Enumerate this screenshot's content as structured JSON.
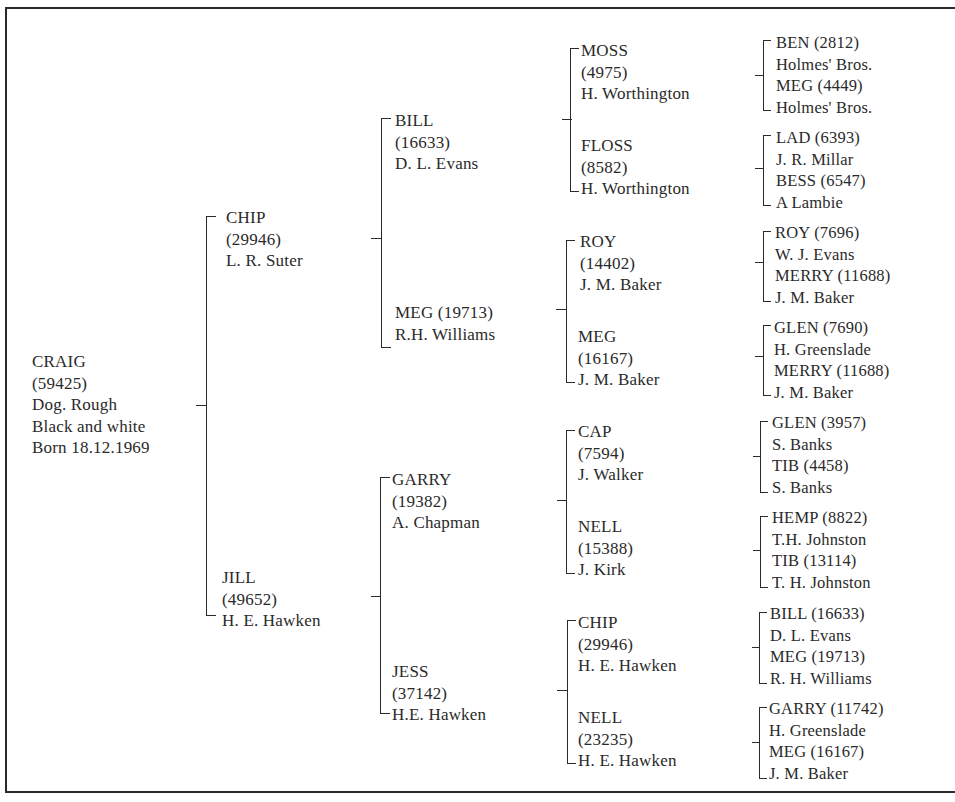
{
  "pedigree": {
    "subject": {
      "name": "CRAIG",
      "reg": "(59425)",
      "sex_coat": "Dog. Rough",
      "colour": "Black and white",
      "born": "Born 18.12.1969"
    },
    "parents": [
      {
        "name": "CHIP",
        "reg": "(29946)",
        "breeder": "L. R. Suter"
      },
      {
        "name": "JILL",
        "reg": "(49652)",
        "breeder": "H. E. Hawken"
      }
    ],
    "grandparents": [
      {
        "name": "BILL",
        "reg": "(16633)",
        "breeder": "D. L. Evans"
      },
      {
        "name_reg": "MEG (19713)",
        "breeder": "R.H. Williams"
      },
      {
        "name": "GARRY",
        "reg": "(19382)",
        "breeder": "A. Chapman"
      },
      {
        "name": "JESS",
        "reg": "(37142)",
        "breeder": "H.E. Hawken"
      }
    ],
    "great_grandparents": [
      {
        "name": "MOSS",
        "reg": "(4975)",
        "breeder": "H. Worthington"
      },
      {
        "name": "FLOSS",
        "reg": "(8582)",
        "breeder": "H. Worthington"
      },
      {
        "name": "ROY",
        "reg": "(14402)",
        "breeder": "J. M. Baker"
      },
      {
        "name": "MEG",
        "reg": "(16167)",
        "breeder": "J. M. Baker"
      },
      {
        "name": "CAP",
        "reg": "(7594)",
        "breeder": "J. Walker"
      },
      {
        "name": "NELL",
        "reg": "(15388)",
        "breeder": "J. Kirk"
      },
      {
        "name": "CHIP",
        "reg": "(29946)",
        "breeder": "H. E. Hawken"
      },
      {
        "name": "NELL",
        "reg": "(23235)",
        "breeder": "H. E. Hawken"
      }
    ],
    "great_great_grandparents": [
      {
        "sire": "BEN (2812)",
        "sire_breeder": "Holmes' Bros.",
        "dam": "MEG (4449)",
        "dam_breeder": "Holmes' Bros."
      },
      {
        "sire": "LAD (6393)",
        "sire_breeder": "J. R. Millar",
        "dam": "BESS (6547)",
        "dam_breeder": "A Lambie"
      },
      {
        "sire": "ROY (7696)",
        "sire_breeder": "W. J. Evans",
        "dam": "MERRY (11688)",
        "dam_breeder": "J. M. Baker"
      },
      {
        "sire": "GLEN (7690)",
        "sire_breeder": "H. Greenslade",
        "dam": "MERRY (11688)",
        "dam_breeder": "J. M. Baker"
      },
      {
        "sire": "GLEN (3957)",
        "sire_breeder": "S. Banks",
        "dam": "TIB (4458)",
        "dam_breeder": "S. Banks"
      },
      {
        "sire": "HEMP (8822)",
        "sire_breeder": "T.H. Johnston",
        "dam": "TIB (13114)",
        "dam_breeder": "T. H. Johnston"
      },
      {
        "sire": "BILL (16633)",
        "sire_breeder": "D. L. Evans",
        "dam": "MEG (19713)",
        "dam_breeder": "R. H. Williams"
      },
      {
        "sire": "GARRY (11742)",
        "sire_breeder": "H. Greenslade",
        "dam": "MEG (16167)",
        "dam_breeder": "J. M. Baker"
      }
    ]
  }
}
